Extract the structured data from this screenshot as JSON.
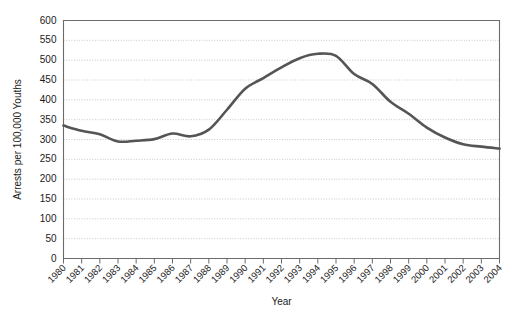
{
  "chart_data": {
    "type": "line",
    "title": "",
    "xlabel": "Year",
    "ylabel": "Arrests per 100,000 Youths",
    "xlim": [
      1980,
      2004
    ],
    "ylim": [
      0,
      600
    ],
    "ytick_step": 50,
    "grid": true,
    "legend": "none",
    "line_color": "#555555",
    "categories": [
      "1980",
      "1981",
      "1982",
      "1983",
      "1984",
      "1985",
      "1986",
      "1987",
      "1988",
      "1989",
      "1990",
      "1991",
      "1992",
      "1993",
      "1994",
      "1995",
      "1996",
      "1997",
      "1998",
      "1999",
      "2000",
      "2001",
      "2002",
      "2003",
      "2004"
    ],
    "values": [
      335,
      322,
      313,
      295,
      297,
      301,
      315,
      308,
      325,
      375,
      428,
      455,
      482,
      505,
      516,
      511,
      465,
      440,
      395,
      365,
      330,
      305,
      288,
      282,
      277
    ],
    "ytick_labels": [
      "600",
      "550",
      "500",
      "450",
      "400",
      "350",
      "300",
      "250",
      "200",
      "150",
      "100",
      "50",
      "0"
    ],
    "ytick_values": [
      600,
      550,
      500,
      450,
      400,
      350,
      300,
      250,
      200,
      150,
      100,
      50,
      0
    ]
  }
}
